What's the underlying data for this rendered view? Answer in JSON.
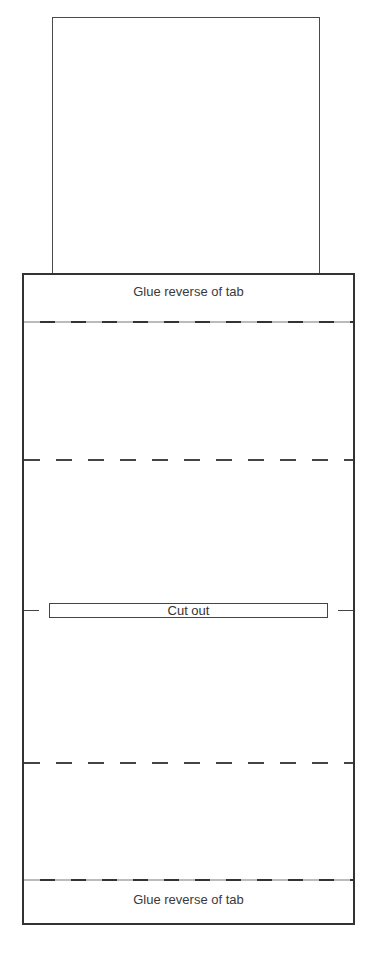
{
  "template": {
    "type": "folding-tab-template",
    "panels": {
      "top_card": {
        "label": ""
      },
      "glue_tab_top": {
        "label": "Glue reverse of tab"
      },
      "cut_out": {
        "label": "Cut out"
      },
      "glue_tab_bottom": {
        "label": "Glue reverse of tab"
      }
    },
    "fold_lines": [
      {
        "id": "fold-1",
        "style": "dashed-glue",
        "y": 321
      },
      {
        "id": "fold-2",
        "style": "dashed",
        "y": 458
      },
      {
        "id": "fold-3",
        "style": "dashed",
        "y": 762
      },
      {
        "id": "fold-4",
        "style": "dashed-glue",
        "y": 879
      }
    ],
    "colors": {
      "stroke": "#333333",
      "text": "#3a3a3a",
      "background": "#ffffff"
    }
  }
}
